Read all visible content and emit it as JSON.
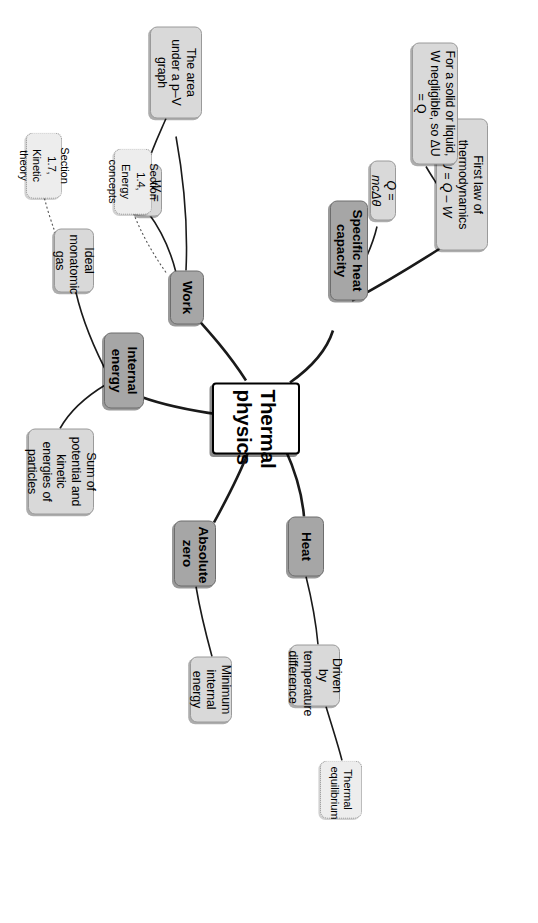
{
  "diagram": {
    "type": "mind-map",
    "title": "Thermal physics",
    "orientation_deg": 90,
    "colors": {
      "center_fill": "#ffffff",
      "center_border": "#000000",
      "level1_fill": "#a6a6a6",
      "level2_fill": "#d9d9d9",
      "xref_fill": "#ededed",
      "link_stroke": "#1a1a1a",
      "xref_stroke": "#555555"
    }
  },
  "center": {
    "label": "Thermal physics"
  },
  "branches": [
    {
      "id": "specific-heat-capacity",
      "label": "Specific heat capacity",
      "children": [
        {
          "id": "q-mc-delta-theta",
          "label": "Q = mcΔθ",
          "italic": true
        },
        {
          "id": "first-law",
          "label": "First law of thermodynamics ΔU = Q – W",
          "line1": "First law of thermodynamics",
          "line2": "ΔU = Q – W",
          "children": [
            {
              "id": "solid-or-liquid",
              "label": "For a solid or liquid, W negligible, so ΔU = Q"
            }
          ]
        }
      ]
    },
    {
      "id": "heat",
      "label": "Heat",
      "children": [
        {
          "id": "driven-by-temperature-difference",
          "label": "Driven by temperature difference",
          "children": [
            {
              "id": "thermal-equilibrium",
              "label": "Thermal equilibrium",
              "style": "xref"
            }
          ]
        }
      ]
    },
    {
      "id": "absolute-zero",
      "label": "Absolute zero",
      "children": [
        {
          "id": "minimum-internal-energy",
          "label": "Minimum internal energy"
        }
      ]
    },
    {
      "id": "internal-energy",
      "label": "Internal energy",
      "children": [
        {
          "id": "sum-of-energies",
          "label": "Sum of potential and kinetic energies of particles"
        },
        {
          "id": "ideal-monatomic-gas",
          "label": "Ideal monatomic gas"
        }
      ]
    },
    {
      "id": "work",
      "label": "Work",
      "children": [
        {
          "id": "w-p-delta-v",
          "label": "W = pΔV",
          "italic": true
        },
        {
          "id": "area-under-pv-graph",
          "label": "The area under a p–V graph"
        }
      ]
    }
  ],
  "cross_references": [
    {
      "id": "section-1-4",
      "line1": "Section 1.4,",
      "line2": "Energy concepts",
      "label": "Section 1.4, Energy concepts",
      "links_to": "work"
    },
    {
      "id": "section-1-7",
      "line1": "Section 1.7,",
      "line2": "Kinetic theory",
      "label": "Section 1.7, Kinetic theory",
      "links_to": "ideal-monatomic-gas"
    }
  ]
}
